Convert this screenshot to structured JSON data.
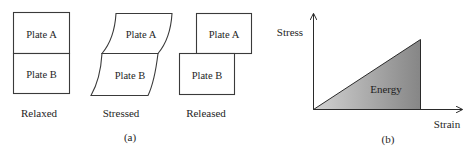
{
  "panel_a": {
    "caption": "(a)",
    "states": [
      {
        "label": "Relaxed",
        "plate_top": "Plate A",
        "plate_bottom": "Plate B"
      },
      {
        "label": "Stressed",
        "plate_top": "Plate A",
        "plate_bottom": "Plate B"
      },
      {
        "label": "Released",
        "plate_top": "Plate A",
        "plate_bottom": "Plate B"
      }
    ]
  },
  "panel_b": {
    "caption": "(b)",
    "y_axis_label": "Stress",
    "x_axis_label": "Strain",
    "area_label": "Energy",
    "colors": {
      "fill_light": "#cfcfcf",
      "fill_dark": "#858585",
      "line": "#2a2a2a"
    }
  }
}
